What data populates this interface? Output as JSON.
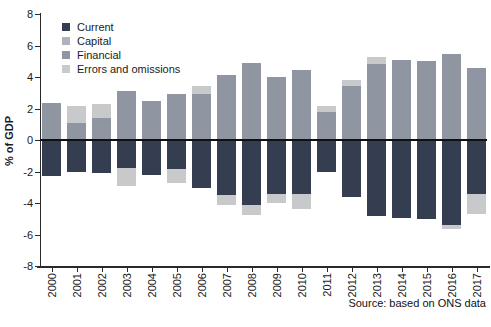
{
  "chart_data": {
    "type": "bar",
    "stacked": true,
    "title": "",
    "ylabel": "% of GDP",
    "xlabel": "",
    "ylim": [
      -8,
      8
    ],
    "yticks": [
      8,
      6,
      4,
      2,
      0,
      -2,
      -4,
      -6,
      -8
    ],
    "grid": false,
    "legend_position": "top-left",
    "source_note": "Source: based on ONS data",
    "categories": [
      "2000",
      "2001",
      "2002",
      "2003",
      "2004",
      "2005",
      "2006",
      "2007",
      "2008",
      "2009",
      "2010",
      "2011",
      "2012",
      "2013",
      "2014",
      "2015",
      "2016",
      "2017"
    ],
    "series": [
      {
        "name": "Current",
        "color": "#343e50",
        "values": [
          -2.3,
          -2.05,
          -2.1,
          -1.8,
          -2.2,
          -1.85,
          -3.05,
          -3.5,
          -4.1,
          -3.4,
          -3.4,
          -2.0,
          -3.6,
          -4.8,
          -4.95,
          -5.0,
          -5.4,
          -3.4
        ]
      },
      {
        "name": "Capital",
        "color": "#aeb3bc",
        "values": [
          0,
          0,
          0,
          0,
          0,
          0,
          0,
          0,
          0,
          0,
          0,
          0,
          0,
          0,
          0,
          0,
          0,
          0
        ]
      },
      {
        "name": "Financial",
        "color": "#8f95a1",
        "values": [
          2.35,
          1.1,
          1.4,
          3.1,
          2.45,
          2.9,
          2.95,
          4.15,
          4.9,
          4.0,
          4.45,
          1.75,
          3.4,
          4.85,
          5.1,
          5.0,
          5.45,
          4.55
        ]
      },
      {
        "name": "Errors and omissions",
        "color": "#c7c9cb",
        "values": [
          0,
          1.05,
          0.9,
          -1.15,
          0,
          -0.9,
          0.45,
          -0.65,
          -0.65,
          -0.6,
          -1.0,
          0.4,
          0.4,
          0.4,
          0,
          0,
          -0.25,
          -1.3
        ]
      }
    ]
  }
}
